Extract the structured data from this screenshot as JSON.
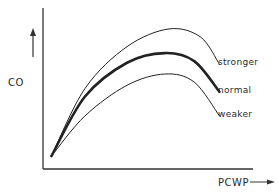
{
  "chart_data": {
    "type": "line",
    "title": "",
    "xlabel": "PCWP",
    "ylabel": "CO",
    "x_arrow": true,
    "y_arrow": true,
    "grid": false,
    "legend": "inline-right",
    "xlim": [
      0,
      10
    ],
    "ylim": [
      0,
      10
    ],
    "series": [
      {
        "name": "stronger",
        "label": "stronger",
        "weight": "thin",
        "x": [
          0.4,
          2,
          4,
          6,
          7.5,
          8.4
        ],
        "y": [
          0.8,
          5.0,
          7.6,
          8.7,
          8.2,
          6.5
        ]
      },
      {
        "name": "normal",
        "label": "normal",
        "weight": "bold",
        "x": [
          0.4,
          2,
          4,
          5.8,
          7.2,
          8.4
        ],
        "y": [
          0.8,
          4.5,
          6.6,
          7.2,
          6.7,
          4.8
        ]
      },
      {
        "name": "weaker",
        "label": "weaker",
        "weight": "thin",
        "x": [
          0.4,
          2,
          4,
          5.8,
          7.2,
          8.4
        ],
        "y": [
          0.8,
          3.3,
          5.2,
          5.9,
          5.4,
          3.3
        ]
      }
    ]
  }
}
